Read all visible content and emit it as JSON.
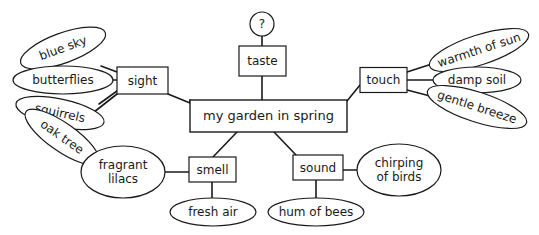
{
  "diagram": {
    "title": "my garden in spring",
    "type": "mind-map",
    "background_color": "#ffffff",
    "line_color": "#1a1a1a",
    "central": {
      "label": "my garden in spring",
      "shape": "rectangle",
      "x": 268.5,
      "y": 116,
      "w": 157,
      "h": 32
    },
    "unknown_node": {
      "label": "?",
      "shape": "circle",
      "x": 262,
      "y": 24,
      "r": 12
    },
    "branches": [
      {
        "label": "sight",
        "shape": "rectangle",
        "x": 142.5,
        "y": 80.5,
        "w": 51,
        "h": 27,
        "leaves": [
          {
            "label": "blue sky",
            "shape": "ellipse",
            "x": 63,
            "y": 48,
            "rx": 45,
            "ry": 15,
            "rot": -20,
            "lines": [
              "blue sky"
            ]
          },
          {
            "label": "butterflies",
            "shape": "ellipse",
            "x": 63,
            "y": 80,
            "rx": 50,
            "ry": 14,
            "rot": 0,
            "lines": [
              "butterflies"
            ]
          },
          {
            "label": "squirrels",
            "shape": "ellipse",
            "x": 60,
            "y": 113,
            "rx": 45,
            "ry": 14,
            "rot": 12,
            "lines": [
              "squirrels"
            ]
          },
          {
            "label": "oak tree",
            "shape": "ellipse",
            "x": 62,
            "y": 137,
            "rx": 44,
            "ry": 14,
            "rot": 35,
            "lines": [
              "oak tree"
            ]
          }
        ]
      },
      {
        "label": "taste",
        "shape": "rectangle",
        "x": 262.5,
        "y": 61,
        "w": 47,
        "h": 30,
        "leaves": []
      },
      {
        "label": "touch",
        "shape": "rectangle",
        "x": 383.5,
        "y": 80,
        "w": 47,
        "h": 25,
        "leaves": [
          {
            "label": "warmth of sun",
            "shape": "ellipse",
            "x": 479,
            "y": 50,
            "rx": 52,
            "ry": 15,
            "rot": -18,
            "lines": [
              "warmth of sun"
            ]
          },
          {
            "label": "damp soil",
            "shape": "ellipse",
            "x": 477,
            "y": 80,
            "rx": 44,
            "ry": 13,
            "rot": 0,
            "lines": [
              "damp soil"
            ]
          },
          {
            "label": "gentle breeze",
            "shape": "ellipse",
            "x": 477,
            "y": 107,
            "rx": 52,
            "ry": 15,
            "rot": 18,
            "lines": [
              "gentle breeze"
            ]
          }
        ]
      },
      {
        "label": "smell",
        "shape": "rectangle",
        "x": 212.5,
        "y": 169.5,
        "w": 47,
        "h": 25,
        "leaves": [
          {
            "label": "fragrant lilacs",
            "shape": "ellipse",
            "x": 123,
            "y": 172,
            "rx": 42,
            "ry": 26,
            "rot": 0,
            "lines": [
              "fragrant",
              "lilacs"
            ]
          },
          {
            "label": "fresh air",
            "shape": "ellipse",
            "x": 213,
            "y": 212,
            "rx": 43,
            "ry": 14,
            "rot": 0,
            "lines": [
              "fresh air"
            ]
          }
        ]
      },
      {
        "label": "sound",
        "shape": "rectangle",
        "x": 318,
        "y": 167.5,
        "w": 50,
        "h": 25,
        "leaves": [
          {
            "label": "chirping of birds",
            "shape": "ellipse",
            "x": 399,
            "y": 170,
            "rx": 42,
            "ry": 26,
            "rot": 0,
            "lines": [
              "chirping",
              "of birds"
            ]
          },
          {
            "label": "hum of bees",
            "shape": "ellipse",
            "x": 316,
            "y": 212,
            "rx": 48,
            "ry": 14,
            "rot": 0,
            "lines": [
              "hum of bees"
            ]
          }
        ]
      }
    ],
    "edges": [
      {
        "name": "edge-sight-to-central",
        "d": "M 168 94 L 190 103 L 190 100"
      },
      {
        "name": "edge-taste-to-central",
        "d": "M 262 76 L 262 100"
      },
      {
        "name": "edge-touch-to-central",
        "d": "M 360 85 L 347 101"
      },
      {
        "name": "edge-central-to-smell",
        "d": "M 237 132 L 213 157"
      },
      {
        "name": "edge-central-to-sound",
        "d": "M 274 132 L 296 155"
      },
      {
        "name": "edge-unknown-to-taste",
        "d": "M 262 36 L 262 46"
      },
      {
        "name": "edge-sight-blue-sky",
        "d": "M 117 72 L 101 66"
      },
      {
        "name": "edge-sight-butterflies",
        "d": "M 117 80 L 108 80"
      },
      {
        "name": "edge-sight-squirrels",
        "d": "M 117 91 L 99 104"
      },
      {
        "name": "edge-sight-oak-tree",
        "d": "M 117 94 L 89 116"
      },
      {
        "name": "edge-touch-warmth",
        "d": "M 407 72 L 435 63"
      },
      {
        "name": "edge-touch-damp-soil",
        "d": "M 407 80 L 434 80"
      },
      {
        "name": "edge-touch-gentle",
        "d": "M 407 90 L 434 97"
      },
      {
        "name": "edge-smell-lilacs",
        "d": "M 189 172 L 164 172"
      },
      {
        "name": "edge-smell-fresh-air",
        "d": "M 212 182 L 212 199"
      },
      {
        "name": "edge-sound-chirping",
        "d": "M 343 170 L 358 170"
      },
      {
        "name": "edge-sound-hum",
        "d": "M 316 180 L 316 199"
      }
    ]
  }
}
